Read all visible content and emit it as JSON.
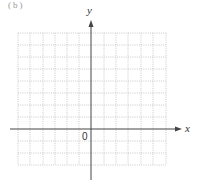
{
  "header": {
    "fragment": "(b)"
  },
  "axes": {
    "x_label": "x",
    "y_label": "y",
    "origin_label": "0"
  },
  "grid": {
    "columns": 12,
    "rows": 11,
    "style": "dotted",
    "color": "#bbbbbb"
  },
  "colors": {
    "axis": "#444444",
    "grid": "#bbbbbb",
    "text": "#333333"
  }
}
